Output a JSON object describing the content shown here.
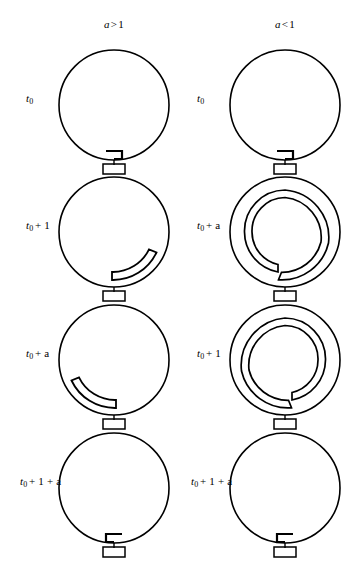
{
  "figure": {
    "background": "#ffffff",
    "stroke_color": "#000000",
    "width": 359,
    "height": 570
  },
  "columns": [
    {
      "id": "col-a-gt-1",
      "header_var": "a",
      "header_op": ">",
      "header_num": "1",
      "header_text": "a > 1",
      "center_x": 114
    },
    {
      "id": "col-a-lt-1",
      "header_var": "a",
      "header_op": "<",
      "header_num": "1",
      "header_text": "a < 1",
      "center_x": 285
    }
  ],
  "rows": [
    {
      "index": 0,
      "center_y": 110,
      "left": {
        "label_var": "t",
        "label_sub": "0",
        "label_rest": "",
        "label_text": "t0",
        "state": "seed-hook-left"
      },
      "right": {
        "label_var": "t",
        "label_sub": "0",
        "label_rest": "",
        "label_text": "t0",
        "state": "seed-hook-left"
      }
    },
    {
      "index": 1,
      "center_y": 237,
      "left": {
        "label_var": "t",
        "label_sub": "0",
        "label_rest": "+ 1",
        "label_text": "t0 + 1",
        "state": "short-arc-right"
      },
      "right": {
        "label_var": "t",
        "label_sub": "0",
        "label_rest": "+ a",
        "label_text": "t0 + a",
        "state": "spiral-ccw"
      }
    },
    {
      "index": 2,
      "center_y": 365,
      "left": {
        "label_var": "t",
        "label_sub": "0",
        "label_rest": "+ a",
        "label_text": "t0 + a",
        "state": "short-arc-left"
      },
      "right": {
        "label_var": "t",
        "label_sub": "0",
        "label_rest": "+ 1",
        "label_text": "t0 + 1",
        "state": "spiral-cw"
      }
    },
    {
      "index": 3,
      "center_y": 493,
      "left": {
        "label_var": "t",
        "label_sub": "0",
        "label_rest": "+ 1 + a",
        "label_text": "t0 + 1 + a",
        "state": "seed-hook-right"
      },
      "right": {
        "label_var": "t",
        "label_sub": "0",
        "label_rest": "+ 1 + a",
        "label_text": "t0 + 1 + a",
        "state": "seed-hook-right"
      }
    }
  ],
  "geometry": {
    "ring_radius": 55,
    "stem_length": 17,
    "coupler_width": 22,
    "coupler_height": 11,
    "line_width": 1.6,
    "band_gap": 6
  }
}
